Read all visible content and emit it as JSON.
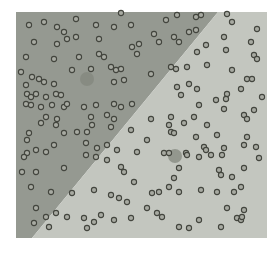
{
  "chart_data": {
    "type": "scatter",
    "canvas": {
      "width": 280,
      "height": 255,
      "background": "#ffffff"
    },
    "plot_area": {
      "x": 16,
      "y": 12,
      "width": 251,
      "height": 226
    },
    "grid": "off",
    "legend": "none",
    "regions": [
      {
        "name": "class-region-upper-left",
        "color": "#959991",
        "polygon": [
          [
            16,
            12
          ],
          [
            218,
            12
          ],
          [
            32,
            238
          ],
          [
            16,
            238
          ]
        ]
      },
      {
        "name": "class-region-lower-right",
        "color": "#c3c6bf",
        "polygon": [
          [
            218,
            12
          ],
          [
            267,
            12
          ],
          [
            267,
            238
          ],
          [
            32,
            238
          ]
        ]
      }
    ],
    "decision_boundary": {
      "from": [
        218,
        12
      ],
      "to": [
        32,
        238
      ]
    },
    "centroid_style": {
      "r": 7,
      "fill": "#83877d"
    },
    "centroids": [
      {
        "x": 87,
        "y": 79
      },
      {
        "x": 175,
        "y": 156
      }
    ],
    "point_style": {
      "r": 2.6,
      "fill": "#a8aaa2",
      "stroke": "#43453e",
      "stroke_width": 1.1
    },
    "points": [
      [
        121,
        13
      ],
      [
        29,
        25
      ],
      [
        44,
        22
      ],
      [
        57,
        27
      ],
      [
        76,
        19
      ],
      [
        96,
        25
      ],
      [
        114,
        27
      ],
      [
        131,
        25
      ],
      [
        64,
        32
      ],
      [
        67,
        39
      ],
      [
        76,
        37
      ],
      [
        99,
        39
      ],
      [
        34,
        42
      ],
      [
        57,
        44
      ],
      [
        139,
        44
      ],
      [
        132,
        47
      ],
      [
        26,
        57
      ],
      [
        54,
        59
      ],
      [
        79,
        57
      ],
      [
        99,
        54
      ],
      [
        104,
        57
      ],
      [
        137,
        54
      ],
      [
        91,
        69
      ],
      [
        111,
        67
      ],
      [
        116,
        70
      ],
      [
        121,
        69
      ],
      [
        72,
        70
      ],
      [
        21,
        72
      ],
      [
        32,
        77
      ],
      [
        39,
        79
      ],
      [
        44,
        82
      ],
      [
        26,
        85
      ],
      [
        54,
        84
      ],
      [
        114,
        82
      ],
      [
        124,
        80
      ],
      [
        27,
        94
      ],
      [
        31,
        97
      ],
      [
        36,
        94
      ],
      [
        46,
        97
      ],
      [
        56,
        94
      ],
      [
        61,
        95
      ],
      [
        26,
        104
      ],
      [
        31,
        105
      ],
      [
        41,
        107
      ],
      [
        52,
        105
      ],
      [
        64,
        107
      ],
      [
        67,
        104
      ],
      [
        84,
        107
      ],
      [
        96,
        105
      ],
      [
        114,
        104
      ],
      [
        121,
        107
      ],
      [
        132,
        104
      ],
      [
        46,
        117
      ],
      [
        57,
        119
      ],
      [
        91,
        117
      ],
      [
        107,
        115
      ],
      [
        114,
        119
      ],
      [
        177,
        15
      ],
      [
        196,
        17
      ],
      [
        201,
        15
      ],
      [
        227,
        14
      ],
      [
        166,
        20
      ],
      [
        232,
        22
      ],
      [
        257,
        29
      ],
      [
        189,
        32
      ],
      [
        196,
        30
      ],
      [
        154,
        34
      ],
      [
        174,
        37
      ],
      [
        224,
        37
      ],
      [
        251,
        42
      ],
      [
        159,
        42
      ],
      [
        179,
        42
      ],
      [
        206,
        45
      ],
      [
        226,
        50
      ],
      [
        197,
        52
      ],
      [
        254,
        55
      ],
      [
        257,
        59
      ],
      [
        151,
        74
      ],
      [
        171,
        67
      ],
      [
        176,
        69
      ],
      [
        187,
        67
      ],
      [
        207,
        65
      ],
      [
        232,
        70
      ],
      [
        247,
        79
      ],
      [
        252,
        79
      ],
      [
        189,
        84
      ],
      [
        177,
        87
      ],
      [
        197,
        89
      ],
      [
        241,
        89
      ],
      [
        181,
        95
      ],
      [
        227,
        94
      ],
      [
        226,
        99
      ],
      [
        216,
        100
      ],
      [
        262,
        97
      ],
      [
        199,
        105
      ],
      [
        224,
        109
      ],
      [
        254,
        110
      ],
      [
        244,
        115
      ],
      [
        247,
        119
      ],
      [
        194,
        117
      ],
      [
        171,
        117
      ],
      [
        151,
        119
      ],
      [
        41,
        123
      ],
      [
        56,
        125
      ],
      [
        92,
        125
      ],
      [
        111,
        127
      ],
      [
        131,
        130
      ],
      [
        29,
        133
      ],
      [
        64,
        133
      ],
      [
        77,
        132
      ],
      [
        87,
        132
      ],
      [
        27,
        140
      ],
      [
        54,
        145
      ],
      [
        36,
        150
      ],
      [
        46,
        152
      ],
      [
        27,
        153
      ],
      [
        24,
        157
      ],
      [
        86,
        143
      ],
      [
        97,
        148
      ],
      [
        107,
        145
      ],
      [
        117,
        150
      ],
      [
        86,
        155
      ],
      [
        96,
        157
      ],
      [
        137,
        152
      ],
      [
        107,
        160
      ],
      [
        22,
        172
      ],
      [
        36,
        172
      ],
      [
        64,
        168
      ],
      [
        121,
        167
      ],
      [
        124,
        172
      ],
      [
        134,
        182
      ],
      [
        31,
        187
      ],
      [
        51,
        192
      ],
      [
        72,
        193
      ],
      [
        94,
        190
      ],
      [
        111,
        195
      ],
      [
        119,
        198
      ],
      [
        127,
        202
      ],
      [
        36,
        208
      ],
      [
        46,
        217
      ],
      [
        56,
        213
      ],
      [
        67,
        217
      ],
      [
        84,
        218
      ],
      [
        101,
        215
      ],
      [
        94,
        222
      ],
      [
        114,
        220
      ],
      [
        131,
        218
      ],
      [
        34,
        223
      ],
      [
        49,
        227
      ],
      [
        87,
        228
      ],
      [
        169,
        125
      ],
      [
        184,
        123
      ],
      [
        207,
        125
      ],
      [
        171,
        132
      ],
      [
        174,
        133
      ],
      [
        196,
        137
      ],
      [
        217,
        135
      ],
      [
        247,
        137
      ],
      [
        147,
        140
      ],
      [
        204,
        147
      ],
      [
        206,
        150
      ],
      [
        224,
        148
      ],
      [
        244,
        145
      ],
      [
        256,
        147
      ],
      [
        164,
        153
      ],
      [
        169,
        153
      ],
      [
        186,
        153
      ],
      [
        187,
        155
      ],
      [
        199,
        157
      ],
      [
        211,
        155
      ],
      [
        222,
        155
      ],
      [
        259,
        158
      ],
      [
        179,
        168
      ],
      [
        219,
        170
      ],
      [
        221,
        175
      ],
      [
        232,
        177
      ],
      [
        244,
        168
      ],
      [
        174,
        178
      ],
      [
        169,
        187
      ],
      [
        179,
        192
      ],
      [
        201,
        190
      ],
      [
        217,
        192
      ],
      [
        234,
        192
      ],
      [
        241,
        187
      ],
      [
        152,
        193
      ],
      [
        159,
        192
      ],
      [
        147,
        208
      ],
      [
        157,
        213
      ],
      [
        162,
        217
      ],
      [
        227,
        208
      ],
      [
        244,
        210
      ],
      [
        199,
        220
      ],
      [
        237,
        218
      ],
      [
        241,
        220
      ],
      [
        242,
        217
      ],
      [
        179,
        227
      ],
      [
        189,
        228
      ],
      [
        221,
        227
      ]
    ]
  }
}
